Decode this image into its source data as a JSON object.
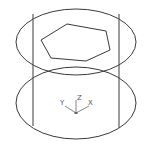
{
  "drawing": {
    "description": "Isometric CAD wireframe of a cylinder with a hexagonal cutout on top",
    "colors": {
      "background": "#ffffff",
      "line": "#3a3a3a",
      "ucs": "#666666"
    },
    "ucs_icon": {
      "axis_labels": {
        "y": "Y",
        "z": "Z",
        "x": "X"
      }
    }
  }
}
